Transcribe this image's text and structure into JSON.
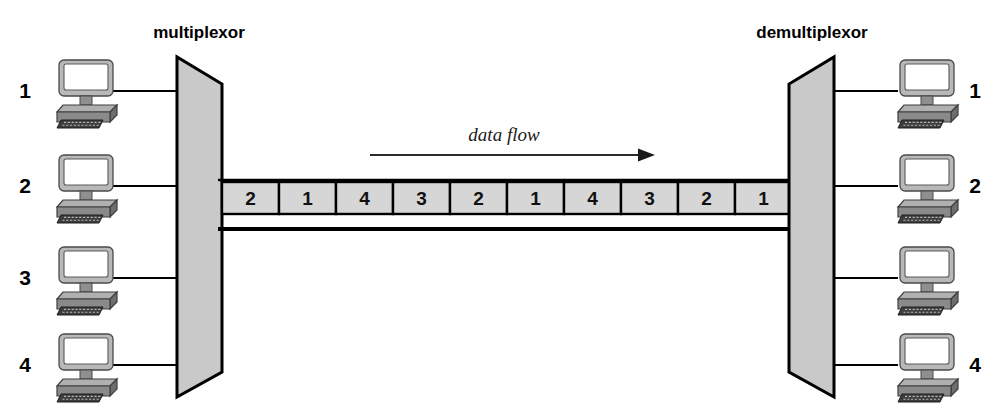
{
  "diagram": {
    "title_left": "multiplexor",
    "title_right": "demultiplexor",
    "flow_label": "data flow",
    "left_ports": [
      {
        "label": "1"
      },
      {
        "label": "2"
      },
      {
        "label": "3"
      },
      {
        "label": "4"
      }
    ],
    "right_ports": [
      {
        "label": "1"
      },
      {
        "label": "2"
      },
      {
        "label": ""
      },
      {
        "label": "4"
      }
    ],
    "stream_cells": [
      {
        "label": "2"
      },
      {
        "label": "1"
      },
      {
        "label": "4"
      },
      {
        "label": "3"
      },
      {
        "label": "2"
      },
      {
        "label": "1"
      },
      {
        "label": "4"
      },
      {
        "label": "3"
      },
      {
        "label": "2"
      },
      {
        "label": "1"
      }
    ],
    "colors": {
      "mux_fill": "#c9c9c9",
      "cell_fill": "#d6d6d6",
      "stroke": "#000000",
      "monitor_body": "#b8b8b8",
      "monitor_screen": "#ffffff",
      "base_top": "#a8a8a8",
      "base_front": "#6e6e6e",
      "keyboard": "#3a3a3a"
    }
  }
}
